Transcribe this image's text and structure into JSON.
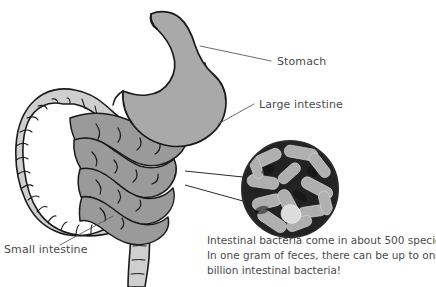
{
  "figure": {
    "background_color": "#ffffff",
    "organs": [
      {
        "id": "stomach",
        "label": "Stomach",
        "fill_color": "#a9a9a9",
        "stroke_color": "#1a1a1a"
      },
      {
        "id": "large-intestine",
        "label": "Large intestine",
        "fill_color": "#cfcfcf",
        "stroke_color": "#1a1a1a"
      },
      {
        "id": "small-intestine",
        "label": "Small intestine",
        "fill_color": "#9a9a9a",
        "stroke_color": "#1a1a1a"
      }
    ]
  },
  "labels": {
    "stomach": "Stomach",
    "large_intestine": "Large intestine",
    "small_intestine": "Small intestine",
    "text_color": "#4a4a4a",
    "leader_line_color": "#5a5a5a"
  },
  "inset": {
    "type": "electron-micrograph",
    "subject": "rod-shaped intestinal bacteria",
    "shape": "circle",
    "background_color": "#1c1c1c",
    "bacteria_color": "#b4b4b4",
    "border_color": "#2a2a2a",
    "center_x": 290,
    "center_y": 189,
    "radius": 49
  },
  "caption": {
    "lines": [
      "Intestinal bacteria come in about 500 species.",
      "In one gram of feces, there can be up to one",
      "billion intestinal bacteria!"
    ],
    "line1": "Intestinal bacteria come in about 500 species.",
    "line2": "In one gram of feces, there can be up to one",
    "line3": "billion intestinal bacteria!",
    "text_color": "#4a4a4a"
  }
}
